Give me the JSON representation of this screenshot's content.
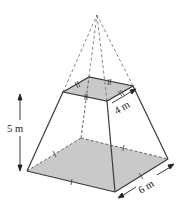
{
  "figure": {
    "type": "frustum of a square pyramid",
    "labels": {
      "height": "5 m",
      "top_side": "4 m",
      "bottom_side": "6 m"
    },
    "colors": {
      "face_fill": "#c9c9c9",
      "line": "#3a3a3a",
      "dashed": "#555555"
    }
  }
}
